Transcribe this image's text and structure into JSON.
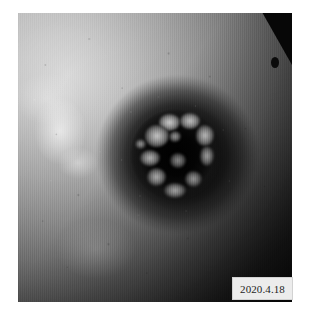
{
  "page": {
    "background_color": "#ffffff",
    "width": 309,
    "height": 311
  },
  "photo": {
    "alt_label": "clinical-photograph",
    "subject": "nipple-areola lesion",
    "color_mode": "grayscale",
    "frame": {
      "left": 18,
      "top": 13,
      "width": 274,
      "height": 289
    },
    "regions": [
      {
        "name": "surrounding-skin",
        "tone": "#9a9a9a",
        "description": "mottled breast skin, bright upper-left, shadowed lower-right"
      },
      {
        "name": "areola-ring",
        "tone": "#1c1c1c",
        "description": "dark pigmented areolar ring"
      },
      {
        "name": "central-crater",
        "tone": "#050505",
        "description": "dark ulcerated central crater"
      },
      {
        "name": "nodular-fragments",
        "tone": "#b9b9b9",
        "description": "pale irregular nodular tissue fragments around crater rim"
      },
      {
        "name": "corner-wedge",
        "tone": "#070707",
        "description": "dark wedge artefact at upper-right corner"
      }
    ]
  },
  "date_stamp": {
    "text": "2020.4.18",
    "background_color": "#ececec",
    "text_color": "#1e1e1e",
    "border_color": "#d2d2d2",
    "position": "bottom-right"
  }
}
